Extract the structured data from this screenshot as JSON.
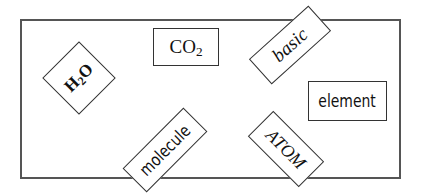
{
  "diagram": {
    "frame_color": "#555555",
    "cards": [
      {
        "id": "h2o",
        "main": "H",
        "sub": "2",
        "tail": "O",
        "style": "serif-bold",
        "rotation_deg": -45
      },
      {
        "id": "co2",
        "main": "CO",
        "sub": "2",
        "tail": "",
        "style": "serif",
        "rotation_deg": 0
      },
      {
        "id": "basic",
        "label": "basic",
        "style": "serif-italic",
        "rotation_deg": -42
      },
      {
        "id": "element",
        "label": "element",
        "style": "sans-condensed",
        "rotation_deg": 0
      },
      {
        "id": "molecule",
        "label": "molecule",
        "style": "sans-condensed",
        "rotation_deg": -45
      },
      {
        "id": "atom",
        "label": "ATOM",
        "style": "serif-italic",
        "rotation_deg": 45
      }
    ]
  }
}
